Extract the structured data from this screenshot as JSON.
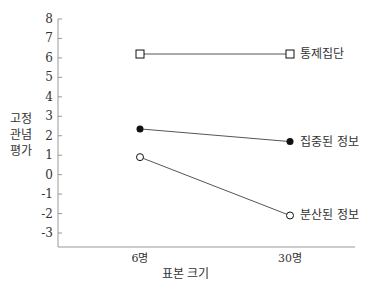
{
  "chart_data": {
    "type": "line",
    "title": "",
    "xlabel": "표본 크기",
    "ylabel": "고정 관념 평가",
    "ylabel_lines": [
      "고정",
      "관념",
      "평가"
    ],
    "categories": [
      "6명",
      "30명"
    ],
    "ylim": [
      -3,
      8
    ],
    "yticks": [
      -3,
      -2,
      -1,
      0,
      1,
      2,
      3,
      4,
      5,
      6,
      7,
      8
    ],
    "grid": false,
    "legend_position": "inline-right",
    "series": [
      {
        "name": "통제집단",
        "marker": "open-square",
        "values": [
          6.2,
          6.2
        ]
      },
      {
        "name": "집중된 정보",
        "marker": "filled-circle",
        "values": [
          2.35,
          1.7
        ]
      },
      {
        "name": "분산된 정보",
        "marker": "open-circle",
        "values": [
          0.9,
          -2.1
        ]
      }
    ]
  },
  "colors": {
    "axis": "#999999",
    "line": "#555555",
    "marker": "#111111",
    "text": "#333333"
  }
}
